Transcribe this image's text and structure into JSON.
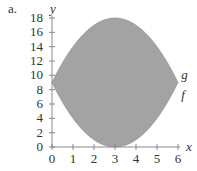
{
  "panel_label": "a.",
  "colors": {
    "fill": "#a3a3a3",
    "axis": "#888888",
    "text": "#333333"
  },
  "chart_data": {
    "type": "area",
    "title": "",
    "xlabel": "x",
    "ylabel": "y",
    "xlim": [
      0,
      6
    ],
    "ylim": [
      0,
      18
    ],
    "x_ticks": [
      "0",
      "1",
      "2",
      "3",
      "4",
      "5",
      "6"
    ],
    "y_ticks": [
      "0",
      "2",
      "4",
      "6",
      "8",
      "10",
      "12",
      "14",
      "16",
      "18"
    ],
    "grid": false,
    "series": [
      {
        "name": "g",
        "x": [
          0,
          1,
          2,
          3,
          4,
          5,
          6
        ],
        "values": [
          9,
          14,
          17,
          18,
          17,
          14,
          9
        ]
      },
      {
        "name": "f",
        "x": [
          0,
          1,
          2,
          3,
          4,
          5,
          6
        ],
        "values": [
          9,
          4,
          1,
          0,
          1,
          4,
          9
        ]
      }
    ],
    "annotations": [
      {
        "text": "g",
        "x": 6.15,
        "y": 10
      },
      {
        "text": "f",
        "x": 6.15,
        "y": 7.2
      }
    ],
    "shaded_region": "between f and g for 0 ≤ x ≤ 6"
  }
}
